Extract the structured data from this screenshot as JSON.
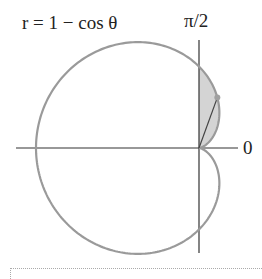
{
  "labels": {
    "equation": "r = 1 − cos θ",
    "top_axis": "π/2",
    "right_axis": "0"
  },
  "colors": {
    "curve": "#9a9a9a",
    "shade": "#d4d4d4",
    "axis": "#333333",
    "point": "#a0a0a0"
  },
  "diagram": {
    "type": "polar-curve",
    "equation": "r = 1 - cos(theta)",
    "shaded_region": "theta from 0 to pi/2",
    "marked_point_theta_deg": 70
  }
}
